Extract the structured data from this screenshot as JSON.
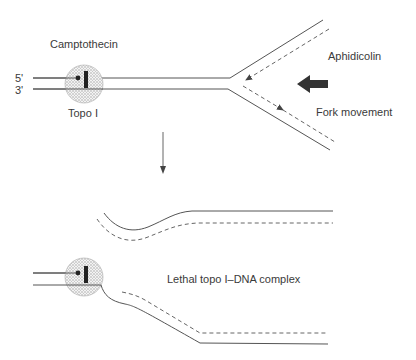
{
  "labels": {
    "drug_top": "Camptothecin",
    "five_prime": "5'",
    "three_prime": "3'",
    "enzyme": "Topo I",
    "inhibitor": "Aphidicolin",
    "fork_movement": "Fork movement",
    "lethal_complex": "Lethal topo I–DNA complex"
  },
  "colors": {
    "line": "#555555",
    "text": "#3a3a3a",
    "topo_fill": "#c8c8c8",
    "topo_bar": "#222222",
    "bold_arrow": "#333333"
  },
  "icons": {
    "process_arrow": "down-arrow",
    "fork_direction": "bold-left-arrow"
  }
}
